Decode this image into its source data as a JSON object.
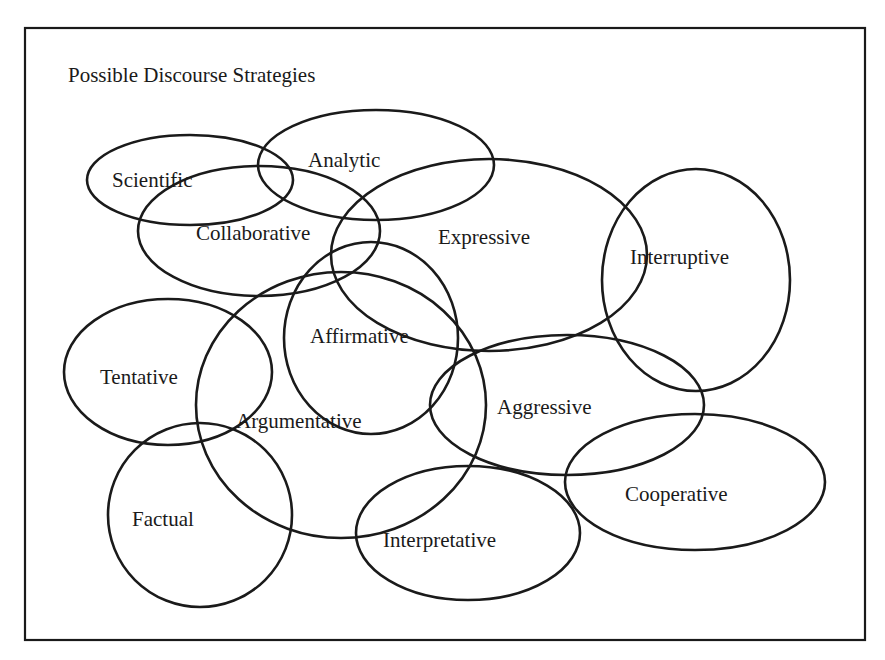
{
  "title": "Possible Discourse Strategies",
  "colors": {
    "ink": "#1a1a1a",
    "background": "#ffffff"
  },
  "frame": {
    "x": 25,
    "y": 28,
    "width": 840,
    "height": 612
  },
  "strategies": [
    {
      "id": "scientific",
      "label": "Scientific",
      "cx": 190,
      "cy": 180,
      "rx": 103,
      "ry": 45,
      "tx": 112,
      "ty": 187
    },
    {
      "id": "analytic",
      "label": "Analytic",
      "cx": 376,
      "cy": 165,
      "rx": 118,
      "ry": 55,
      "tx": 308,
      "ty": 167
    },
    {
      "id": "collaborative",
      "label": "Collaborative",
      "cx": 259,
      "cy": 231,
      "rx": 121,
      "ry": 65,
      "tx": 196,
      "ty": 240
    },
    {
      "id": "expressive",
      "label": "Expressive",
      "cx": 489,
      "cy": 255,
      "rx": 158,
      "ry": 96,
      "tx": 438,
      "ty": 244
    },
    {
      "id": "interruptive",
      "label": "Interruptive",
      "cx": 696,
      "cy": 280,
      "rx": 94,
      "ry": 111,
      "tx": 630,
      "ty": 264
    },
    {
      "id": "affirmative",
      "label": "Affirmative",
      "cx": 371,
      "cy": 338,
      "rx": 87,
      "ry": 96,
      "tx": 310,
      "ty": 343
    },
    {
      "id": "tentative",
      "label": "Tentative",
      "cx": 168,
      "cy": 372,
      "rx": 104,
      "ry": 73,
      "tx": 100,
      "ty": 384
    },
    {
      "id": "argumentative",
      "label": "Argumentative",
      "cx": 341,
      "cy": 405,
      "rx": 145,
      "ry": 133,
      "tx": 236,
      "ty": 428
    },
    {
      "id": "factual",
      "label": "Factual",
      "cx": 200,
      "cy": 515,
      "rx": 92,
      "ry": 92,
      "tx": 132,
      "ty": 526
    },
    {
      "id": "aggressive",
      "label": "Aggressive",
      "cx": 567,
      "cy": 405,
      "rx": 137,
      "ry": 70,
      "tx": 497,
      "ty": 414
    },
    {
      "id": "interpretative",
      "label": "Interpretative",
      "cx": 468,
      "cy": 533,
      "rx": 112,
      "ry": 67,
      "tx": 383,
      "ty": 547
    },
    {
      "id": "cooperative",
      "label": "Cooperative",
      "cx": 695,
      "cy": 482,
      "rx": 130,
      "ry": 68,
      "tx": 625,
      "ty": 501
    }
  ]
}
